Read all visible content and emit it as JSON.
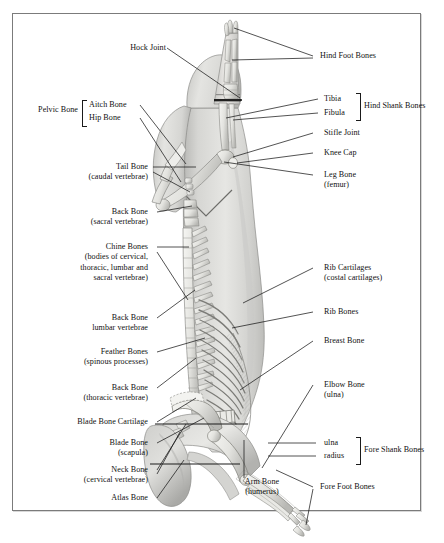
{
  "document": {
    "title": "Pork Carcass Skeletal Structure Diagram",
    "subject": "Side view of a split pork carcass showing bone names",
    "frame": {
      "border_color": "#7b7b7b",
      "background": "#ffffff"
    }
  },
  "colors": {
    "ink": "#111111",
    "leader": "#1a1a1a",
    "frame": "#7b7b7b",
    "carcass_light": "#e2e2e0",
    "carcass_mid": "#c8c8c6",
    "carcass_dark": "#9a9a98",
    "bone_light": "#f4f4f2",
    "bone_shadow": "#b6b6b4"
  },
  "labels_left": [
    {
      "id": "hock-joint",
      "lines": [
        "Hock Joint"
      ]
    },
    {
      "id": "pelvic-bone",
      "lines": [
        "Pelvic Bone"
      ]
    },
    {
      "id": "aitch-bone",
      "lines": [
        "Aitch Bone"
      ]
    },
    {
      "id": "hip-bone",
      "lines": [
        "Hip Bone"
      ]
    },
    {
      "id": "tail-bone",
      "lines": [
        "Tail Bone",
        "(caudal vertebrae)"
      ]
    },
    {
      "id": "back-bone-sacral",
      "lines": [
        "Back Bone",
        "(sacral vertebrae)"
      ]
    },
    {
      "id": "chine-bones",
      "lines": [
        "Chine Bones",
        "(bodies of cervical,",
        "thoracic, lumbar and",
        "sacral vertebrae)"
      ]
    },
    {
      "id": "back-bone-lumbar",
      "lines": [
        "Back Bone",
        "lumbar vertebrae"
      ]
    },
    {
      "id": "feather-bones",
      "lines": [
        "Feather Bones",
        "(spinous processes)"
      ]
    },
    {
      "id": "back-bone-thoracic",
      "lines": [
        "Back Bone",
        "(thoracic vertebrae)"
      ]
    },
    {
      "id": "blade-bone-cartilage",
      "lines": [
        "Blade Bone Cartilage"
      ]
    },
    {
      "id": "blade-bone",
      "lines": [
        "Blade Bone",
        "(scapula)"
      ]
    },
    {
      "id": "neck-bone",
      "lines": [
        "Neck Bone",
        "(cervical vertebrae)"
      ]
    },
    {
      "id": "atlas-bone",
      "lines": [
        "Atlas Bone"
      ]
    }
  ],
  "labels_right": [
    {
      "id": "hind-foot-bones",
      "lines": [
        "Hind Foot Bones"
      ]
    },
    {
      "id": "tibia",
      "lines": [
        "Tibia"
      ]
    },
    {
      "id": "fibula",
      "lines": [
        "Fibula"
      ]
    },
    {
      "id": "hind-shank-bones",
      "lines": [
        "Hind Shank Bones"
      ]
    },
    {
      "id": "stifle-joint",
      "lines": [
        "Stifle Joint"
      ]
    },
    {
      "id": "knee-cap",
      "lines": [
        "Knee Cap"
      ]
    },
    {
      "id": "leg-bone",
      "lines": [
        "Leg Bone",
        "(femur)"
      ]
    },
    {
      "id": "rib-cartilages",
      "lines": [
        "Rib Cartilages",
        "(costal cartilages)"
      ]
    },
    {
      "id": "rib-bones",
      "lines": [
        "Rib Bones"
      ]
    },
    {
      "id": "breast-bone",
      "lines": [
        "Breast Bone"
      ]
    },
    {
      "id": "elbow-bone",
      "lines": [
        "Elbow Bone",
        "(ulna)"
      ]
    },
    {
      "id": "ulna",
      "lines": [
        "ulna"
      ]
    },
    {
      "id": "radius",
      "lines": [
        "radius"
      ]
    },
    {
      "id": "fore-shank-bones",
      "lines": [
        "Fore Shank Bones"
      ]
    },
    {
      "id": "fore-foot-bones",
      "lines": [
        "Fore Foot Bones"
      ]
    }
  ],
  "labels_center": [
    {
      "id": "arm-bone",
      "lines": [
        "Arm Bone",
        "(humerus)"
      ]
    }
  ]
}
